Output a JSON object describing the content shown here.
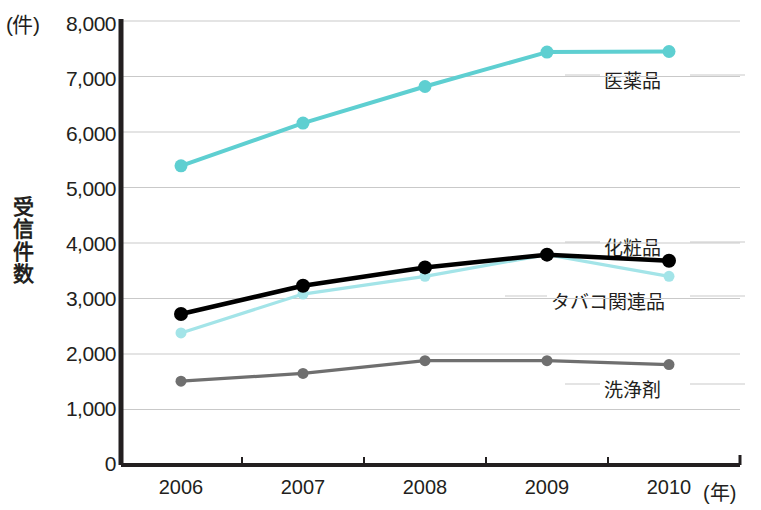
{
  "chart_data": {
    "type": "line",
    "title": "",
    "subtitle": "",
    "xlabel": "(年)",
    "ylabel": "受信件数",
    "y_unit_label": "(件)",
    "x": [
      "2006",
      "2007",
      "2008",
      "2009",
      "2010"
    ],
    "categories": [
      "2006",
      "2007",
      "2008",
      "2009",
      "2010"
    ],
    "ylim": [
      0,
      8000
    ],
    "y_ticks": [
      "0",
      "1,000",
      "2,000",
      "3,000",
      "4,000",
      "5,000",
      "6,000",
      "7,000",
      "8,000"
    ],
    "y_tick_values": [
      0,
      1000,
      2000,
      3000,
      4000,
      5000,
      6000,
      7000,
      8000
    ],
    "grid": true,
    "grid_axis": "y",
    "legend_position": "inline-right",
    "series": [
      {
        "name": "医薬品",
        "color": "#5ecfd1",
        "values": [
          5390,
          6160,
          6820,
          7440,
          7450
        ]
      },
      {
        "name": "化粧品",
        "color": "#000000",
        "values": [
          2720,
          3230,
          3560,
          3790,
          3680
        ]
      },
      {
        "name": "タバコ関連品",
        "color": "#a3e4e8",
        "values": [
          2380,
          3080,
          3400,
          3790,
          3400
        ]
      },
      {
        "name": "洗浄剤",
        "color": "#6f6f6f",
        "values": [
          1510,
          1650,
          1880,
          1880,
          1810
        ]
      }
    ],
    "annotations": [
      {
        "text": "医薬品",
        "series": "医薬品"
      },
      {
        "text": "化粧品",
        "series": "化粧品"
      },
      {
        "text": "タバコ関連品",
        "series": "タバコ関連品"
      },
      {
        "text": "洗浄剤",
        "series": "洗浄剤"
      }
    ]
  },
  "axis": {
    "y_title_chars": [
      "受",
      "信",
      "件",
      "数"
    ],
    "axis_color": "#231f20",
    "grid_color": "#c9c9c9"
  }
}
